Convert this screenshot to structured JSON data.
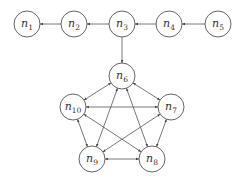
{
  "diagram": {
    "type": "directed-graph",
    "node_radius": 13,
    "nodes": [
      {
        "id": "n1",
        "base": "n",
        "sub": "1",
        "x": 27,
        "y": 24
      },
      {
        "id": "n2",
        "base": "n",
        "sub": "2",
        "x": 74,
        "y": 24
      },
      {
        "id": "n3",
        "base": "n",
        "sub": "3",
        "x": 122,
        "y": 24
      },
      {
        "id": "n4",
        "base": "n",
        "sub": "4",
        "x": 169,
        "y": 24
      },
      {
        "id": "n5",
        "base": "n",
        "sub": "5",
        "x": 218,
        "y": 24
      },
      {
        "id": "n6",
        "base": "n",
        "sub": "6",
        "x": 122,
        "y": 76
      },
      {
        "id": "n7",
        "base": "n",
        "sub": "7",
        "x": 171,
        "y": 107
      },
      {
        "id": "n8",
        "base": "n",
        "sub": "8",
        "x": 152,
        "y": 159
      },
      {
        "id": "n9",
        "base": "n",
        "sub": "9",
        "x": 92,
        "y": 159
      },
      {
        "id": "n10",
        "base": "n",
        "sub": "10",
        "x": 73,
        "y": 107
      }
    ],
    "edges": [
      {
        "from": "n2",
        "to": "n1",
        "bidirectional": false
      },
      {
        "from": "n3",
        "to": "n2",
        "bidirectional": false
      },
      {
        "from": "n4",
        "to": "n3",
        "bidirectional": false
      },
      {
        "from": "n5",
        "to": "n4",
        "bidirectional": false
      },
      {
        "from": "n3",
        "to": "n6",
        "bidirectional": false
      },
      {
        "from": "n6",
        "to": "n7",
        "bidirectional": true
      },
      {
        "from": "n6",
        "to": "n10",
        "bidirectional": true
      },
      {
        "from": "n6",
        "to": "n9",
        "bidirectional": true
      },
      {
        "from": "n6",
        "to": "n8",
        "bidirectional": true
      },
      {
        "from": "n10",
        "to": "n7",
        "bidirectional": true
      },
      {
        "from": "n10",
        "to": "n9",
        "bidirectional": true
      },
      {
        "from": "n10",
        "to": "n8",
        "bidirectional": true
      },
      {
        "from": "n7",
        "to": "n9",
        "bidirectional": true
      },
      {
        "from": "n7",
        "to": "n8",
        "bidirectional": true
      },
      {
        "from": "n9",
        "to": "n8",
        "bidirectional": true
      }
    ]
  }
}
